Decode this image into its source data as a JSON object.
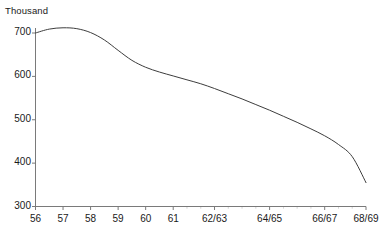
{
  "chart_data": {
    "type": "line",
    "title": "",
    "subtitle": "",
    "ylabel": "Thousand",
    "xlabel": "",
    "grid": false,
    "legend": "none",
    "line_color": "#3d3d3d",
    "axis_color": "#7a7a7a",
    "ylim": [
      300,
      730
    ],
    "yticks": [
      300,
      400,
      500,
      600,
      700
    ],
    "ytick_labels": [
      "300",
      "400",
      "500",
      "600",
      "700"
    ],
    "xtick_labels": [
      "56",
      "57",
      "58",
      "59",
      "60",
      "61",
      "62/63",
      "64/65",
      "66/67",
      "68/69"
    ],
    "x_positions": [
      0,
      1,
      2,
      3,
      4,
      5,
      6.5,
      8.5,
      10.5,
      12
    ],
    "x_axis_range": [
      0,
      12
    ],
    "series": [
      {
        "name": "Thousand",
        "x": [
          0,
          0.5,
          1,
          1.5,
          2,
          2.5,
          3,
          3.5,
          4,
          4.5,
          5,
          5.5,
          6,
          6.5,
          7,
          7.5,
          8,
          8.5,
          9,
          9.5,
          10,
          10.5,
          11,
          11.5,
          12
        ],
        "values": [
          700,
          709,
          712,
          710,
          701,
          684,
          660,
          637,
          621,
          610,
          601,
          592,
          583,
          572,
          560,
          548,
          535,
          522,
          508,
          494,
          479,
          463,
          443,
          415,
          355
        ]
      }
    ]
  }
}
